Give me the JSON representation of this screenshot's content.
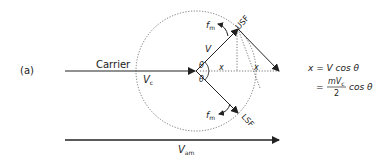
{
  "figure": {
    "panel_label": "(a)",
    "carrier_label": "Carrier",
    "vc_label": "V",
    "vc_sub": "c",
    "v_label": "V",
    "theta_top": "θ",
    "theta_bottom": "θ",
    "x_label_inner": "x",
    "x_label_outer": "x",
    "fm_top": "f",
    "fm_top_sub": "m",
    "fm_bottom": "f",
    "fm_bottom_sub": "m",
    "usf_label": "USF",
    "lsf_label": "LSF",
    "vam_label": "V",
    "vam_sub": "am"
  },
  "equations": {
    "line1": "x = V cos θ",
    "line2_eq": "=",
    "line2_num": "mV",
    "line2_num_sub": "c",
    "line2_den": "2",
    "line2_tail": "cos θ"
  },
  "colors": {
    "stroke": "#222222",
    "dotted": "#555555"
  }
}
